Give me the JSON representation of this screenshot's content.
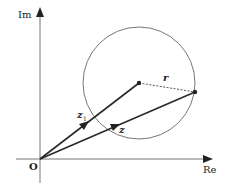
{
  "diagram": {
    "type": "argand-diagram",
    "labels": {
      "imag_axis": "Im",
      "real_axis": "Re",
      "origin": "O",
      "z1": "z",
      "z1_sub": "1",
      "z": "z",
      "radius": "r"
    },
    "geometry": {
      "origin": [
        40,
        159
      ],
      "circle_center": [
        139,
        83
      ],
      "circle_radius": 56,
      "point_on_circle": [
        195,
        92
      ]
    },
    "colors": {
      "axis": "#6b6b6b",
      "vector": "#2a2a2a",
      "circle": "#666666",
      "dashed": "#555555"
    }
  }
}
